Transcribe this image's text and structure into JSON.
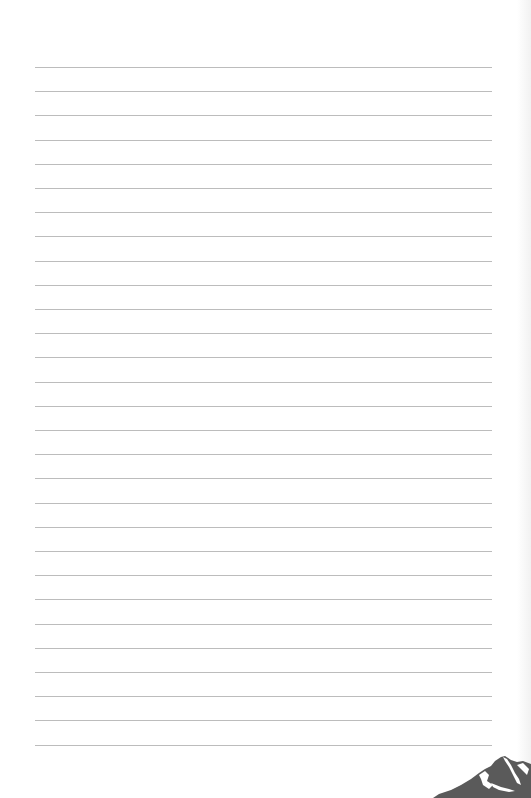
{
  "page": {
    "type": "lined-notebook-page",
    "background_color": "#ffffff",
    "rule_color": "#bcbcbc",
    "rule_count": 29,
    "first_rule_y": 67,
    "rule_spacing": 24.2,
    "rule_left": 35,
    "rule_right": 492
  },
  "decoration": {
    "icon": "mountain-icon",
    "fill_color": "#5a5a5a",
    "snow_color": "#ffffff",
    "position": "bottom-right"
  }
}
